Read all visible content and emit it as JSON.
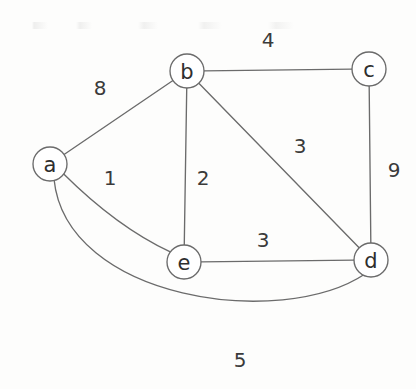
{
  "figure": {
    "type": "undirected-weighted-graph",
    "background_color": "#fdfdfc",
    "stroke_color": "#6b6b6b",
    "text_color": "#2e2e2e"
  },
  "nodes": [
    {
      "id": "a",
      "label": "a",
      "x": 50,
      "y": 164,
      "r": 17
    },
    {
      "id": "b",
      "label": "b",
      "x": 187,
      "y": 71,
      "r": 17
    },
    {
      "id": "c",
      "label": "c",
      "x": 369,
      "y": 69,
      "r": 17
    },
    {
      "id": "d",
      "label": "d",
      "x": 371,
      "y": 260,
      "r": 17
    },
    {
      "id": "e",
      "label": "e",
      "x": 184,
      "y": 262,
      "r": 17
    }
  ],
  "edges": [
    {
      "id": "a-b",
      "source": "a",
      "target": "b",
      "weight": "8",
      "weight_x": 100,
      "weight_y": 88,
      "shape": "line"
    },
    {
      "id": "b-c",
      "source": "b",
      "target": "c",
      "weight": "4",
      "weight_x": 268,
      "weight_y": 40,
      "shape": "line"
    },
    {
      "id": "c-d",
      "source": "c",
      "target": "d",
      "weight": "9",
      "weight_x": 394,
      "weight_y": 170,
      "shape": "line"
    },
    {
      "id": "b-d",
      "source": "b",
      "target": "d",
      "weight": "3",
      "weight_x": 300,
      "weight_y": 146,
      "shape": "line"
    },
    {
      "id": "b-e",
      "source": "b",
      "target": "e",
      "weight": "2",
      "weight_x": 203,
      "weight_y": 178,
      "shape": "line"
    },
    {
      "id": "a-e",
      "source": "a",
      "target": "e",
      "weight": "1",
      "weight_x": 110,
      "weight_y": 178,
      "shape": "curve"
    },
    {
      "id": "e-d",
      "source": "e",
      "target": "d",
      "weight": "3",
      "weight_x": 263,
      "weight_y": 240,
      "shape": "line"
    },
    {
      "id": "a-d",
      "source": "a",
      "target": "d",
      "weight": "5",
      "weight_x": 240,
      "weight_y": 360,
      "shape": "arc"
    }
  ],
  "chart_data": {
    "type": "diagram",
    "title": "",
    "graph_kind": "undirected weighted graph",
    "vertices": [
      "a",
      "b",
      "c",
      "d",
      "e"
    ],
    "edge_list": [
      {
        "from": "a",
        "to": "b",
        "weight": 8
      },
      {
        "from": "a",
        "to": "e",
        "weight": 1
      },
      {
        "from": "a",
        "to": "d",
        "weight": 5
      },
      {
        "from": "b",
        "to": "c",
        "weight": 4
      },
      {
        "from": "b",
        "to": "e",
        "weight": 2
      },
      {
        "from": "b",
        "to": "d",
        "weight": 3
      },
      {
        "from": "c",
        "to": "d",
        "weight": 9
      },
      {
        "from": "e",
        "to": "d",
        "weight": 3
      }
    ]
  }
}
